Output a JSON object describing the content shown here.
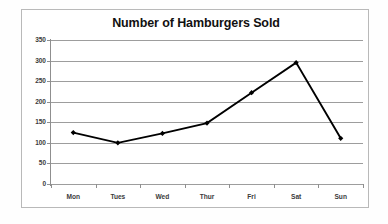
{
  "chart_data": {
    "type": "line",
    "title": "Number of Hamburgers Sold",
    "xlabel": "",
    "ylabel": "",
    "categories": [
      "Mon",
      "Tues",
      "Wed",
      "Thur",
      "Fri",
      "Sat",
      "Sun"
    ],
    "values": [
      125,
      100,
      123,
      148,
      222,
      295,
      111
    ],
    "series": [
      {
        "name": "Hamburgers Sold",
        "values": [
          125,
          100,
          123,
          148,
          222,
          295,
          111
        ]
      }
    ],
    "ylim": [
      0,
      350
    ],
    "ytick_step": 50,
    "ytick_labels": [
      "0",
      "50",
      "100",
      "150",
      "200",
      "250",
      "300",
      "350"
    ],
    "grid": "horizontal",
    "legend": "none",
    "marker": "diamond",
    "line_color": "#000000",
    "gridline_color": "#9d9d9d",
    "axis_color": "#8f8f8f",
    "title_color": "#111111",
    "tick_label_color": "#3b3b3b",
    "plot_background": "#ffffff",
    "border_color": "#b9b9b9"
  }
}
